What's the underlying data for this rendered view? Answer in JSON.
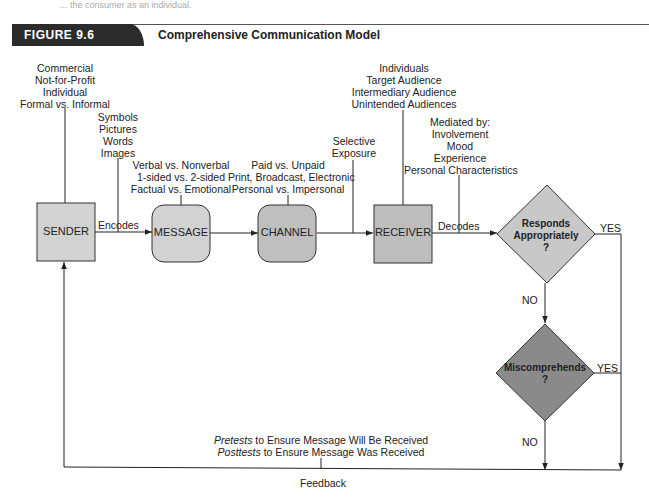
{
  "page": {
    "top_fragment": "... the consumer as an individual."
  },
  "figure": {
    "number": "FIGURE 9.6",
    "title": "Comprehensive Communication Model"
  },
  "nodes": {
    "sender": "SENDER",
    "message": "MESSAGE",
    "channel": "CHANNEL",
    "receiver": "RECEIVER",
    "decision1": [
      "Responds",
      "Appropriately",
      "?"
    ],
    "decision2": [
      "Miscomprehends",
      "?"
    ]
  },
  "annotations": {
    "sender_types": [
      "Commercial",
      "Not-for-Profit",
      "Individual",
      "Formal vs. Informal"
    ],
    "encoding_forms": [
      "Symbols",
      "Pictures",
      "Words",
      "Images"
    ],
    "message_types": [
      "Verbal vs. Nonverbal",
      "1-sided vs. 2-sided",
      "Factual vs. Emotional"
    ],
    "channel_types": [
      "Paid vs. Unpaid",
      "Print, Broadcast, Electronic",
      "Personal vs. Impersonal"
    ],
    "selective_exposure": [
      "Selective",
      "Exposure"
    ],
    "receiver_types": [
      "Individuals",
      "Target Audience",
      "Intermediary Audience",
      "Unintended Audiences"
    ],
    "mediators": [
      "Mediated by:",
      "Involvement",
      "Mood",
      "Experience",
      "Personal Characteristics"
    ]
  },
  "edges": {
    "encodes": "Encodes",
    "decodes": "Decodes",
    "yes1": "YES",
    "no1": "NO",
    "yes2": "YES",
    "no2": "NO",
    "feedback": "Feedback"
  },
  "feedback_notes": {
    "pretests_em": "Pretests",
    "pretests_rest": " to Ensure Message Will Be Received",
    "posttests_em": "Posttests",
    "posttests_rest": " to Ensure Message Was Received"
  },
  "colors": {
    "box_light": "#d2d2d2",
    "box_mid": "#bdbdbd",
    "diamond_light": "#c8c8c8",
    "diamond_dark": "#8a8a8a",
    "line": "#222222",
    "header_dark": "#2c2c2c"
  }
}
